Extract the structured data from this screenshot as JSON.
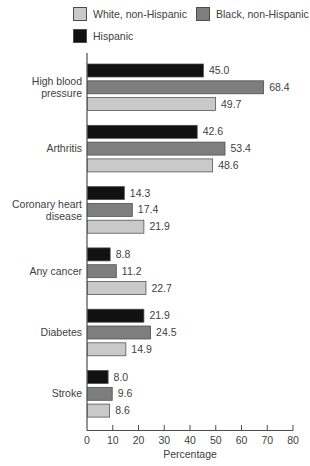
{
  "legend": {
    "items": [
      {
        "label": "White, non-Hispanic",
        "color": "#c9c9c9"
      },
      {
        "label": "Black, non-Hispanic",
        "color": "#7e7e7e"
      },
      {
        "label": "Hispanic",
        "color": "#111111"
      }
    ]
  },
  "chart_data": {
    "type": "bar",
    "orientation": "horizontal",
    "title": "",
    "xlabel": "Percentage",
    "ylabel": "",
    "xlim": [
      0,
      80
    ],
    "xticks": [
      0,
      10,
      20,
      30,
      40,
      50,
      60,
      70,
      80
    ],
    "grid": false,
    "legend_position": "top",
    "value_labels": true,
    "value_label_format": "one-decimal",
    "categories": [
      "High blood pressure",
      "Arthritis",
      "Coronary heart disease",
      "Any cancer",
      "Diabetes",
      "Stroke"
    ],
    "category_lines": [
      [
        "High blood",
        "pressure"
      ],
      [
        "Arthritis"
      ],
      [
        "Coronary heart",
        "disease"
      ],
      [
        "Any cancer"
      ],
      [
        "Diabetes"
      ],
      [
        "Stroke"
      ]
    ],
    "bar_order_top_to_bottom": [
      "Hispanic",
      "Black, non-Hispanic",
      "White, non-Hispanic"
    ],
    "series": [
      {
        "name": "Hispanic",
        "color": "#111111",
        "values": [
          45.0,
          42.6,
          14.3,
          8.8,
          21.9,
          8.0
        ]
      },
      {
        "name": "Black, non-Hispanic",
        "color": "#7e7e7e",
        "values": [
          68.4,
          53.4,
          17.4,
          11.2,
          24.5,
          9.6
        ]
      },
      {
        "name": "White, non-Hispanic",
        "color": "#c9c9c9",
        "values": [
          49.7,
          48.6,
          21.9,
          22.7,
          14.9,
          8.6
        ]
      }
    ]
  },
  "colors": {
    "bar_stroke": "#4c4c4c",
    "axis": "#4c4c4c",
    "text": "#414141",
    "background": "#ffffff"
  }
}
